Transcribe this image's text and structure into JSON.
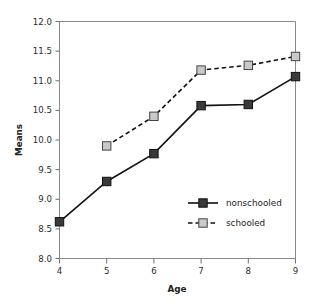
{
  "chart_data": {
    "type": "line",
    "title": "",
    "xlabel": "Age",
    "ylabel": "Means",
    "x": [
      4,
      5,
      6,
      7,
      8,
      9
    ],
    "xlim": [
      4,
      9
    ],
    "ylim": [
      8.0,
      12.0
    ],
    "xticks": [
      "4",
      "5",
      "6",
      "7",
      "8",
      "9"
    ],
    "yticks": [
      "8.0",
      "8.5",
      "9.0",
      "9.5",
      "10.0",
      "10.5",
      "11.0",
      "11.5",
      "12.0"
    ],
    "grid": false,
    "legend_position": "inside lower-right",
    "series": [
      {
        "name": "nonschooled",
        "linestyle": "solid",
        "marker": "square",
        "marker_fill": "#3a3a3a",
        "marker_edge": "#111111",
        "line_color": "#111111",
        "x": [
          4,
          5,
          6,
          7,
          8,
          9
        ],
        "values": [
          8.62,
          9.3,
          9.77,
          10.58,
          10.6,
          11.07
        ]
      },
      {
        "name": "schooled",
        "linestyle": "dashed",
        "marker": "square",
        "marker_fill": "#c9c9c9",
        "marker_edge": "#444444",
        "line_color": "#111111",
        "x": [
          5,
          6,
          7,
          8,
          9
        ],
        "values": [
          9.9,
          10.4,
          11.18,
          11.26,
          11.41
        ]
      }
    ]
  },
  "axes": {
    "y_title": "Means",
    "x_title": "Age",
    "y_tick_labels": [
      "12.0",
      "11.5",
      "11.0",
      "10.5",
      "10.0",
      "9.5",
      "9.0",
      "8.5",
      "8.0"
    ],
    "x_tick_labels": [
      "4",
      "5",
      "6",
      "7",
      "8",
      "9"
    ]
  },
  "legend": {
    "entries": [
      {
        "label": "nonschooled"
      },
      {
        "label": "schooled"
      }
    ]
  },
  "colors": {
    "frame": "#8a8a8a",
    "line": "#111111",
    "nonschooled_fill": "#3a3a3a",
    "schooled_fill": "#c9c9c9",
    "text": "#222222",
    "background": "#ffffff"
  }
}
